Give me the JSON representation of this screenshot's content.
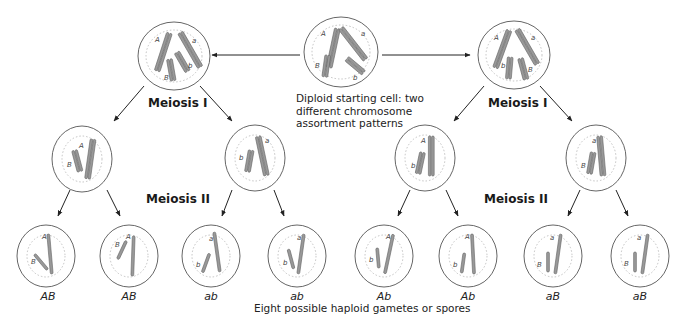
{
  "start_cell": {
    "caption_lines": [
      "Diploid starting cell: two",
      "different chromosome",
      "assortment patterns"
    ]
  },
  "stages": {
    "meiosis1_left": "Meiosis I",
    "meiosis1_right": "Meiosis I",
    "meiosis2_left": "Meiosis II",
    "meiosis2_right": "Meiosis II"
  },
  "allele_labels": {
    "A": "A",
    "a": "a",
    "B": "B",
    "b": "b"
  },
  "gametes": [
    "AB",
    "AB",
    "ab",
    "ab",
    "Ab",
    "Ab",
    "aB",
    "aB"
  ],
  "bottom_caption": "Eight possible haploid gametes or spores",
  "colors": {
    "cell_outline": "#555555",
    "nucleus_dots": "#bbbbbb",
    "chromosome_fill": "#999999",
    "chromosome_stroke": "#666666",
    "arrow": "#222222"
  }
}
